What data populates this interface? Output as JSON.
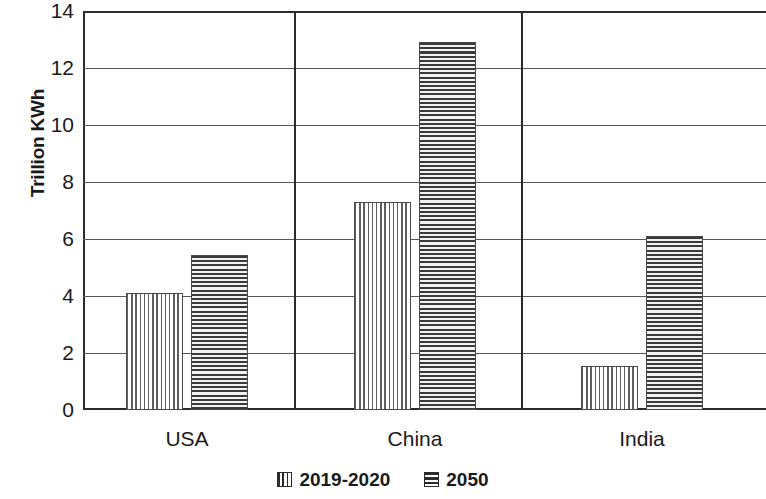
{
  "chart_data": {
    "type": "bar",
    "title": "",
    "xlabel": "",
    "ylabel": "Trillion KWh",
    "categories": [
      "USA",
      "China",
      "India"
    ],
    "series": [
      {
        "name": "2019-2020",
        "pattern": "vertical-stripes",
        "values": [
          4.1,
          7.3,
          1.55
        ]
      },
      {
        "name": "2050",
        "pattern": "horizontal-stripes",
        "values": [
          5.45,
          12.9,
          6.1
        ]
      }
    ],
    "ylim": [
      0,
      14
    ],
    "ytick_step": 2,
    "ytick_labels": [
      "0",
      "2",
      "4",
      "6",
      "8",
      "10",
      "12",
      "14"
    ],
    "grid": "horizontal",
    "group_dividers": true,
    "legend_position": "bottom-center"
  },
  "legend": {
    "items": [
      {
        "label": "2019-2020",
        "pattern": "vertical-stripes"
      },
      {
        "label": "2050",
        "pattern": "horizontal-stripes"
      }
    ]
  },
  "colors": {
    "axis": "#2b2b2b",
    "grid": "#555555",
    "bar_outline": "#4a4a4a",
    "text": "#1a1a1a",
    "background": "#ffffff"
  }
}
